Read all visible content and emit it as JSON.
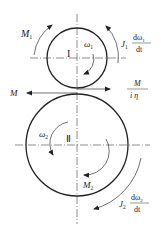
{
  "diagram": {
    "type": "two-gear rotational dynamics free-body diagram",
    "colors": {
      "stroke": "#222222",
      "background": "#ffffff"
    },
    "gear1": {
      "roman_label": "I",
      "torque_label": "M",
      "torque_sub": "1",
      "omega_label": "ω",
      "omega_sub": "1",
      "inertia_label": "J",
      "inertia_sub": "1",
      "frac_num": "dω",
      "frac_num_sub": "1",
      "frac_den": "dt"
    },
    "gear2": {
      "roman_label": "Ⅱ",
      "torque_label": "M",
      "torque_sub": "2",
      "omega_label": "ω",
      "omega_sub": "2",
      "inertia_label": "J",
      "inertia_sub": "2",
      "frac_num": "dω",
      "frac_num_sub": "2",
      "frac_den": "dt"
    },
    "contact": {
      "left_force_label": "M",
      "right_frac_num": "M",
      "right_frac_den": "i η"
    }
  }
}
